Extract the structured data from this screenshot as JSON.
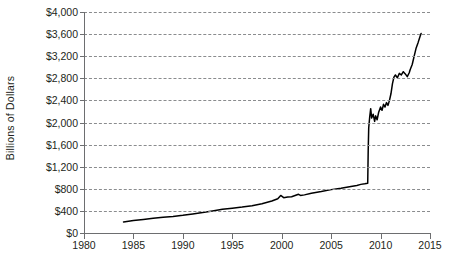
{
  "chart_data": {
    "type": "line",
    "title": "",
    "xlabel": "",
    "ylabel": "Billions of Dollars",
    "xlim": [
      1980,
      2015
    ],
    "ylim": [
      0,
      4000
    ],
    "grid": true,
    "legend": null,
    "y_tick_labels": [
      "$4,000",
      "$3,600",
      "$3,200",
      "$2,800",
      "$2,400",
      "$2,000",
      "$1,600",
      "$1,200",
      "$800",
      "$400",
      "$0"
    ],
    "y_tick_values": [
      4000,
      3600,
      3200,
      2800,
      2400,
      2000,
      1600,
      1200,
      800,
      400,
      0
    ],
    "x_tick_labels": [
      "1980",
      "1985",
      "1990",
      "1995",
      "2000",
      "2005",
      "2010",
      "2015"
    ],
    "x_tick_values": [
      1980,
      1985,
      1990,
      1995,
      2000,
      2005,
      2010,
      2015
    ],
    "series": [
      {
        "name": "Total assets",
        "x": [
          1984.0,
          1985.0,
          1986.0,
          1987.0,
          1988.0,
          1989.0,
          1990.0,
          1991.0,
          1992.0,
          1993.0,
          1994.0,
          1995.0,
          1996.0,
          1997.0,
          1998.0,
          1999.0,
          1999.6,
          1999.9,
          2000.2,
          2000.6,
          2001.0,
          2001.7,
          2001.9,
          2002.3,
          2003.0,
          2004.0,
          2005.0,
          2006.0,
          2007.0,
          2007.6,
          2008.0,
          2008.4,
          2008.7,
          2008.75,
          2008.8,
          2008.9,
          2009.0,
          2009.1,
          2009.25,
          2009.4,
          2009.5,
          2009.65,
          2009.8,
          2010.0,
          2010.15,
          2010.3,
          2010.45,
          2010.6,
          2010.75,
          2010.9,
          2011.05,
          2011.2,
          2011.35,
          2011.5,
          2011.7,
          2011.9,
          2012.1,
          2012.3,
          2012.5,
          2012.7,
          2012.9,
          2013.0,
          2013.2,
          2013.4,
          2013.6,
          2013.8,
          2014.0,
          2014.1
        ],
        "y": [
          200,
          225,
          245,
          265,
          285,
          300,
          320,
          345,
          370,
          400,
          430,
          450,
          470,
          495,
          530,
          580,
          620,
          680,
          640,
          650,
          655,
          700,
          680,
          690,
          720,
          750,
          785,
          810,
          840,
          860,
          880,
          890,
          900,
          1500,
          1900,
          2100,
          2250,
          2080,
          2150,
          2020,
          2120,
          2050,
          2180,
          2280,
          2220,
          2330,
          2280,
          2360,
          2310,
          2400,
          2520,
          2700,
          2820,
          2860,
          2810,
          2890,
          2860,
          2920,
          2880,
          2830,
          2900,
          2960,
          3050,
          3200,
          3350,
          3450,
          3560,
          3610
        ],
        "units": "Billions of Dollars"
      }
    ],
    "annotations": []
  },
  "caption": {
    "text": ""
  }
}
